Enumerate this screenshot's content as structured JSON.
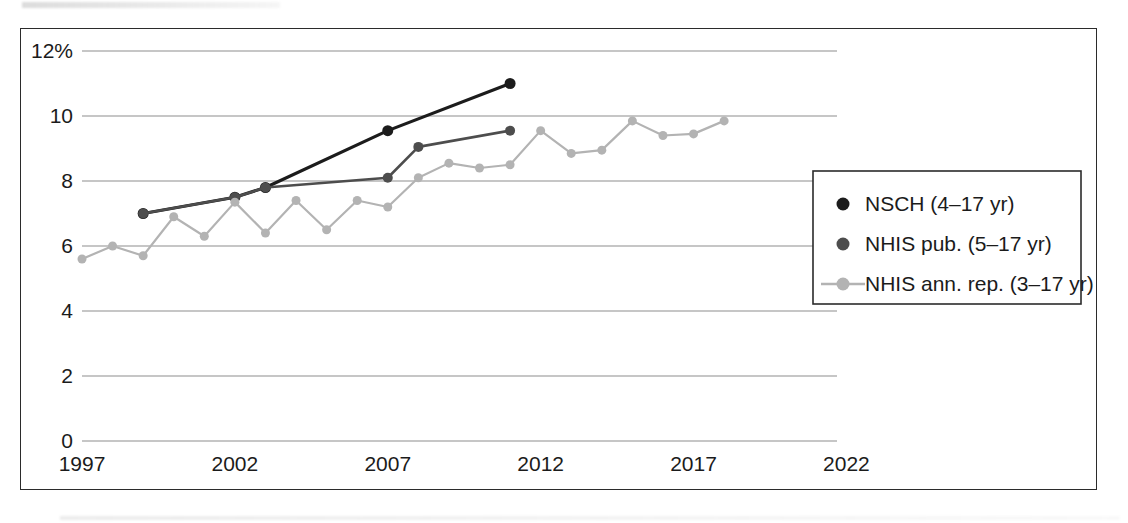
{
  "chart_data": {
    "type": "line",
    "title": "",
    "subtitle": "",
    "xlabel": "",
    "ylabel": "",
    "xlim": [
      1997,
      2023
    ],
    "ylim": [
      0,
      12
    ],
    "grid": true,
    "legend_position": "right",
    "y_ticks": [
      {
        "value": 0,
        "label": "0"
      },
      {
        "value": 2,
        "label": "2"
      },
      {
        "value": 4,
        "label": "4"
      },
      {
        "value": 6,
        "label": "6"
      },
      {
        "value": 8,
        "label": "8"
      },
      {
        "value": 10,
        "label": "10"
      },
      {
        "value": 12,
        "label": "12%"
      }
    ],
    "x_ticks": [
      {
        "value": 1997,
        "label": "1997"
      },
      {
        "value": 2002,
        "label": "2002"
      },
      {
        "value": 2007,
        "label": "2007"
      },
      {
        "value": 2012,
        "label": "2012"
      },
      {
        "value": 2017,
        "label": "2017"
      },
      {
        "value": 2022,
        "label": "2022"
      }
    ],
    "series": [
      {
        "name": "NSCH (4–17 yr)",
        "color": "#1c1c1c",
        "line_width": 3.2,
        "marker": "circle",
        "marker_size": 11,
        "x": [
          1999,
          2002,
          2003,
          2007,
          2011
        ],
        "values": [
          7.0,
          7.5,
          7.8,
          9.55,
          11.0
        ]
      },
      {
        "name": "NHIS pub. (5–17 yr)",
        "color": "#4d4d4d",
        "line_width": 2.6,
        "marker": "circle",
        "marker_size": 10,
        "x": [
          1999,
          2002,
          2003,
          2007,
          2008,
          2011
        ],
        "values": [
          7.0,
          7.5,
          7.8,
          8.1,
          9.05,
          9.55
        ]
      },
      {
        "name": "NHIS ann. rep. (3–17 yr)",
        "color": "#b3b3b3",
        "line_width": 2.2,
        "marker": "circle",
        "marker_size": 9,
        "x": [
          1997,
          1998,
          1999,
          2000,
          2001,
          2002,
          2003,
          2004,
          2005,
          2006,
          2007,
          2008,
          2009,
          2010,
          2011,
          2012,
          2013,
          2014,
          2015,
          2016,
          2017,
          2018
        ],
        "values": [
          5.6,
          6.0,
          5.7,
          6.9,
          6.3,
          7.35,
          6.4,
          7.4,
          6.5,
          7.4,
          7.2,
          8.1,
          8.55,
          8.4,
          8.5,
          9.55,
          8.85,
          8.95,
          9.85,
          9.4,
          9.45,
          9.85
        ]
      }
    ]
  },
  "legend": {
    "entries": [
      {
        "label": "NSCH (4–17 yr)",
        "color": "#1c1c1c",
        "style": "marker"
      },
      {
        "label": "NHIS pub. (5–17 yr)",
        "color": "#4d4d4d",
        "style": "marker"
      },
      {
        "label": "NHIS ann. rep. (3–17 yr)",
        "color": "#b3b3b3",
        "style": "line-marker"
      }
    ]
  }
}
